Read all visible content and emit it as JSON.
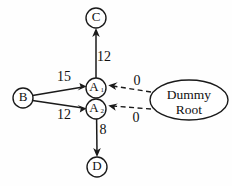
{
  "diagram": {
    "background_color": "#fefefe",
    "stroke_color": "#1a1a1a",
    "nodes": [
      {
        "id": "C",
        "label": "C",
        "sub": "",
        "shape": "circle",
        "cx": 96,
        "cy": 18,
        "r": 10
      },
      {
        "id": "A1",
        "label": "A",
        "sub": "1",
        "shape": "circle",
        "cx": 96,
        "cy": 88,
        "r": 10
      },
      {
        "id": "A2",
        "label": "A",
        "sub": "2",
        "shape": "circle",
        "cx": 96,
        "cy": 109,
        "r": 10
      },
      {
        "id": "B",
        "label": "B",
        "sub": "",
        "shape": "circle",
        "cx": 23,
        "cy": 98,
        "r": 10
      },
      {
        "id": "D",
        "label": "D",
        "sub": "",
        "shape": "circle",
        "cx": 97,
        "cy": 167,
        "r": 10
      },
      {
        "id": "DummyRoot",
        "label_line1": "Dummy",
        "label_line2": "Root",
        "shape": "ellipse",
        "cx": 189,
        "cy": 100,
        "rx": 39,
        "ry": 20
      }
    ],
    "edges": [
      {
        "id": "A1-C",
        "from": "A1",
        "to": "C",
        "style": "solid",
        "label": "12",
        "label_x": 104,
        "label_y": 58
      },
      {
        "id": "B-A1",
        "from": "B",
        "to": "A1",
        "style": "solid",
        "label": "15",
        "label_x": 64,
        "label_y": 78
      },
      {
        "id": "B-A2",
        "from": "B",
        "to": "A2",
        "style": "solid",
        "label": "12",
        "label_x": 64,
        "label_y": 116
      },
      {
        "id": "A2-D",
        "from": "A2",
        "to": "D",
        "style": "solid",
        "label": "8",
        "label_x": 103,
        "label_y": 131
      },
      {
        "id": "Root-A1",
        "from": "DummyRoot",
        "to": "A1",
        "style": "dashed",
        "label": "0",
        "label_x": 137,
        "label_y": 82
      },
      {
        "id": "Root-A2",
        "from": "DummyRoot",
        "to": "A2",
        "style": "dashed",
        "label": "0",
        "label_x": 136,
        "label_y": 119
      }
    ]
  }
}
